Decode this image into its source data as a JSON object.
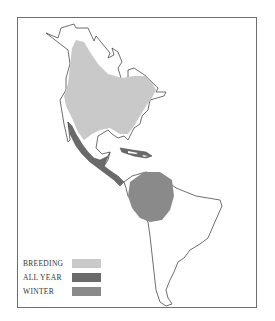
{
  "map": {
    "region": "North and South America",
    "colors": {
      "outline": "#4a4a4a",
      "frame": "#6e6e6e",
      "breeding": "#c9c9c9",
      "all_year": "#6a6a6a",
      "winter": "#8a8a8a",
      "land": "#ffffff"
    }
  },
  "legend": {
    "items": [
      {
        "label": "BREEDING",
        "color": "#c9c9c9"
      },
      {
        "label": "ALL YEAR",
        "color": "#6a6a6a"
      },
      {
        "label": "WINTER",
        "color": "#8a8a8a"
      }
    ]
  }
}
